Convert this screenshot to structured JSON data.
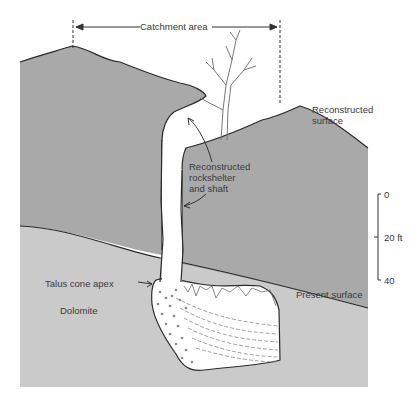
{
  "diagram": {
    "type": "geological cross-section",
    "labels": {
      "catchment": "Catchment area",
      "reconstructed_surface": "Reconstructed\nsurface",
      "rockshelter": "Reconstructed\nrockshelter\nand shaft",
      "talus": "Talus cone apex",
      "dolomite": "Dolomite",
      "present_surface": "Present surface"
    },
    "scale": {
      "ticks": [
        "0",
        "20 ft",
        "40"
      ]
    },
    "colors": {
      "upper_rock": "#a9a9a9",
      "dolomite": "#cacaca",
      "cave_fill": "#ffffff",
      "outline": "#2a2a2a",
      "text": "#3a3a3a"
    }
  }
}
